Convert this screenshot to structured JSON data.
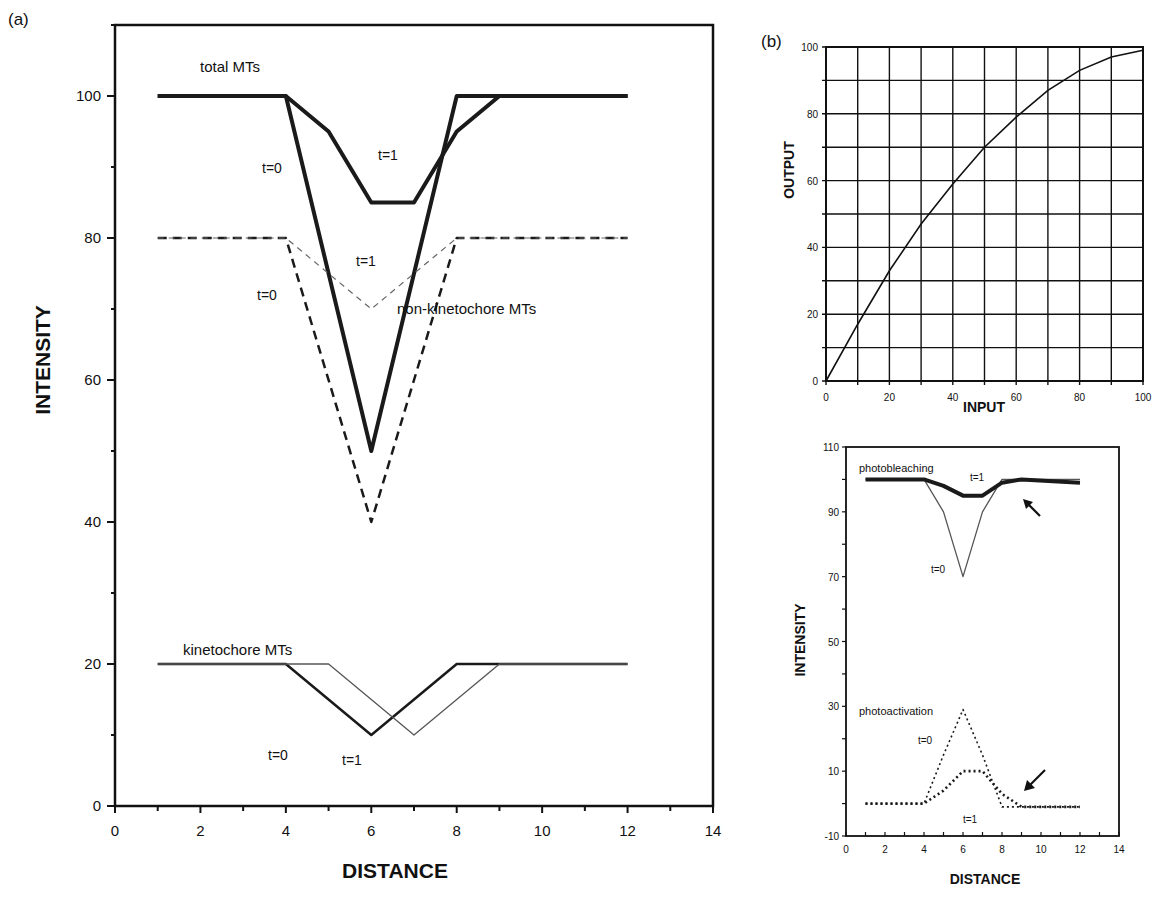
{
  "panels": {
    "a": {
      "label": "(a)"
    },
    "b": {
      "label": "(b)"
    }
  },
  "chart_data": [
    {
      "id": "panel-a",
      "type": "line",
      "title": "",
      "xlabel": "DISTANCE",
      "ylabel": "INTENSITY",
      "xlim": [
        0,
        14
      ],
      "ylim": [
        0,
        110
      ],
      "xticks": [
        "0",
        "2",
        "4",
        "6",
        "8",
        "10",
        "12",
        "14"
      ],
      "yticks": [
        "0",
        "20",
        "40",
        "60",
        "80",
        "100"
      ],
      "grid": false,
      "annotations": [
        {
          "text": "total MTs"
        },
        {
          "text": "t=0",
          "group": "total MTs"
        },
        {
          "text": "t=1",
          "group": "total MTs"
        },
        {
          "text": "t=1",
          "group": "non-kinetochore MTs"
        },
        {
          "text": "t=0",
          "group": "non-kinetochore MTs"
        },
        {
          "text": "non-kinetochore MTs"
        },
        {
          "text": "kinetochore MTs"
        },
        {
          "text": "t=0",
          "group": "kinetochore MTs"
        },
        {
          "text": "t=1",
          "group": "kinetochore MTs"
        }
      ],
      "series": [
        {
          "name": "total MTs t=0",
          "style": "thick solid",
          "x": [
            1,
            4,
            6,
            8,
            12
          ],
          "y": [
            100,
            100,
            50,
            100,
            100
          ]
        },
        {
          "name": "total MTs t=1",
          "style": "thick solid",
          "x": [
            1,
            4,
            5,
            6,
            7,
            8,
            9,
            12
          ],
          "y": [
            100,
            100,
            95,
            85,
            85,
            95,
            100,
            100
          ]
        },
        {
          "name": "non-kinetochore MTs t=0",
          "style": "dashed",
          "x": [
            1,
            4,
            6,
            8,
            12
          ],
          "y": [
            80,
            80,
            40,
            80,
            80
          ]
        },
        {
          "name": "non-kinetochore MTs t=1",
          "style": "thin dashed",
          "x": [
            1,
            4,
            6,
            8,
            12
          ],
          "y": [
            80,
            80,
            70,
            80,
            80
          ]
        },
        {
          "name": "kinetochore MTs t=0",
          "style": "solid",
          "x": [
            1,
            4,
            6,
            8,
            12
          ],
          "y": [
            20,
            20,
            10,
            20,
            20
          ]
        },
        {
          "name": "kinetochore MTs t=1",
          "style": "thin solid",
          "x": [
            1,
            5,
            7,
            9,
            12
          ],
          "y": [
            20,
            20,
            10,
            20,
            20
          ]
        }
      ]
    },
    {
      "id": "panel-b-top",
      "type": "line",
      "title": "",
      "xlabel": "INPUT",
      "ylabel": "OUTPUT",
      "xlim": [
        0,
        100
      ],
      "ylim": [
        0,
        100
      ],
      "xticks": [
        "0",
        "20",
        "40",
        "60",
        "80",
        "100"
      ],
      "yticks": [
        "0",
        "20",
        "40",
        "60",
        "80",
        "100"
      ],
      "grid": true,
      "series": [
        {
          "name": "response curve",
          "x": [
            0,
            10,
            20,
            30,
            40,
            50,
            60,
            70,
            80,
            90,
            100
          ],
          "y": [
            0,
            17,
            33,
            47,
            59,
            70,
            79,
            87,
            93,
            97,
            99
          ]
        }
      ]
    },
    {
      "id": "panel-b-bottom",
      "type": "line",
      "title": "",
      "xlabel": "DISTANCE",
      "ylabel": "INTENSITY",
      "xlim": [
        0,
        14
      ],
      "ylim": [
        -10,
        110
      ],
      "xticks": [
        "0",
        "2",
        "4",
        "6",
        "8",
        "10",
        "12",
        "14"
      ],
      "yticks": [
        "-10",
        "10",
        "30",
        "50",
        "70",
        "90",
        "110"
      ],
      "grid": false,
      "annotations": [
        {
          "text": "photobleaching"
        },
        {
          "text": "t=1",
          "group": "photobleaching"
        },
        {
          "text": "t=0",
          "group": "photobleaching"
        },
        {
          "text": "photoactivation"
        },
        {
          "text": "t=0",
          "group": "photoactivation"
        },
        {
          "text": "t=1",
          "group": "photoactivation"
        },
        {
          "text": "arrow",
          "group": "photobleaching"
        },
        {
          "text": "arrow",
          "group": "photoactivation"
        }
      ],
      "series": [
        {
          "name": "photobleaching t=0",
          "style": "thin solid",
          "x": [
            1,
            4,
            5,
            6,
            7,
            8,
            9,
            12
          ],
          "y": [
            100,
            100,
            90,
            70,
            90,
            100,
            100,
            100
          ]
        },
        {
          "name": "photobleaching t=1",
          "style": "thick solid",
          "x": [
            1,
            4,
            5,
            6,
            7,
            8,
            9,
            12
          ],
          "y": [
            100,
            100,
            98,
            95,
            95,
            99,
            100,
            99
          ]
        },
        {
          "name": "photoactivation t=0",
          "style": "dotted",
          "x": [
            1,
            4,
            5,
            6,
            7,
            8,
            9,
            12
          ],
          "y": [
            0,
            0,
            15,
            29,
            15,
            -1,
            -1,
            -1
          ]
        },
        {
          "name": "photoactivation t=1",
          "style": "thick dotted",
          "x": [
            1,
            4,
            5,
            6,
            7,
            8,
            9,
            12
          ],
          "y": [
            0,
            0,
            4,
            10,
            10,
            3,
            -1,
            -1
          ]
        }
      ]
    }
  ]
}
